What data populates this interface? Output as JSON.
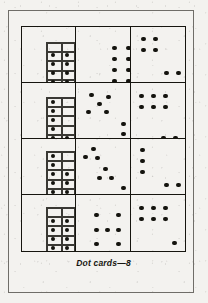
{
  "page": {
    "caption": "Dot cards—8",
    "ink_color": "#14130e",
    "paper_color": "#f3f2ef",
    "border_color": "#6f6d68"
  },
  "cards": [
    {
      "id": "card-r1c1",
      "row": 1,
      "column": 1,
      "total_dots": 9,
      "layout": "ten-frame",
      "frame": {
        "columns": 2,
        "rows": 5,
        "filled_cells": 8,
        "empty_cells": 2,
        "empty_row": "top"
      },
      "loose_dots": 1,
      "frame_dots": [
        {
          "x": 31,
          "y": 28
        },
        {
          "x": 45,
          "y": 28
        },
        {
          "x": 31,
          "y": 37
        },
        {
          "x": 45,
          "y": 37
        },
        {
          "x": 31,
          "y": 46
        },
        {
          "x": 45,
          "y": 46
        },
        {
          "x": 31,
          "y": 55
        },
        {
          "x": 45,
          "y": 55
        }
      ],
      "free_dots": [
        {
          "x": 66,
          "y": 41
        }
      ],
      "frame_box": {
        "x": 24,
        "y": 15,
        "w": 29,
        "h": 46,
        "cols": 2,
        "rows": 5
      }
    },
    {
      "id": "card-r1c2",
      "row": 1,
      "column": 2,
      "total_dots": 8,
      "layout": "array-2x4",
      "frame_box": null,
      "frame_dots": [],
      "free_dots": [
        {
          "x": 38,
          "y": 21
        },
        {
          "x": 52,
          "y": 21
        },
        {
          "x": 38,
          "y": 32
        },
        {
          "x": 52,
          "y": 32
        },
        {
          "x": 38,
          "y": 43
        },
        {
          "x": 52,
          "y": 43
        },
        {
          "x": 38,
          "y": 54
        },
        {
          "x": 52,
          "y": 54
        }
      ]
    },
    {
      "id": "card-r1c3",
      "row": 1,
      "column": 3,
      "total_dots": 8,
      "layout": "two-squares-diagonal",
      "frame_box": null,
      "frame_dots": [],
      "free_dots": [
        {
          "x": 13,
          "y": 12
        },
        {
          "x": 25,
          "y": 12
        },
        {
          "x": 13,
          "y": 23
        },
        {
          "x": 25,
          "y": 23
        },
        {
          "x": 36,
          "y": 46
        },
        {
          "x": 48,
          "y": 46
        },
        {
          "x": 36,
          "y": 57
        },
        {
          "x": 48,
          "y": 57
        }
      ]
    },
    {
      "id": "card-r2c1",
      "row": 2,
      "column": 1,
      "total_dots": 9,
      "layout": "ten-frame",
      "frame": {
        "columns": 2,
        "rows": 5,
        "filled_cells": 6,
        "empty_cells": 4
      },
      "loose_dots": 3,
      "frame_box": {
        "x": 24,
        "y": 14,
        "w": 29,
        "h": 46,
        "cols": 2,
        "rows": 5
      },
      "frame_dots": [
        {
          "x": 31,
          "y": 19
        },
        {
          "x": 31,
          "y": 28
        },
        {
          "x": 31,
          "y": 37
        },
        {
          "x": 31,
          "y": 46
        },
        {
          "x": 31,
          "y": 55
        },
        {
          "x": 45,
          "y": 55
        }
      ],
      "free_dots": [
        {
          "x": 64,
          "y": 22
        },
        {
          "x": 64,
          "y": 32
        },
        {
          "x": 64,
          "y": 42
        }
      ]
    },
    {
      "id": "card-r2c2",
      "row": 2,
      "column": 2,
      "total_dots": 8,
      "layout": "quincunx-plus-column",
      "frame_box": null,
      "frame_dots": [],
      "free_dots": [
        {
          "x": 15,
          "y": 12
        },
        {
          "x": 32,
          "y": 14
        },
        {
          "x": 23,
          "y": 21
        },
        {
          "x": 12,
          "y": 29
        },
        {
          "x": 30,
          "y": 29
        },
        {
          "x": 47,
          "y": 41
        },
        {
          "x": 47,
          "y": 51
        },
        {
          "x": 47,
          "y": 61
        }
      ]
    },
    {
      "id": "card-r2c3",
      "row": 2,
      "column": 3,
      "total_dots": 8,
      "layout": "six-array-plus-pair",
      "frame_box": null,
      "frame_dots": [],
      "free_dots": [
        {
          "x": 11,
          "y": 13
        },
        {
          "x": 23,
          "y": 13
        },
        {
          "x": 35,
          "y": 13
        },
        {
          "x": 11,
          "y": 24
        },
        {
          "x": 23,
          "y": 24
        },
        {
          "x": 35,
          "y": 24
        },
        {
          "x": 33,
          "y": 55
        },
        {
          "x": 45,
          "y": 55
        }
      ]
    },
    {
      "id": "card-r3c1",
      "row": 3,
      "column": 1,
      "total_dots": 8,
      "layout": "ten-frame",
      "frame": {
        "columns": 2,
        "rows": 5,
        "filled_cells": 8,
        "empty_cells": 2
      },
      "loose_dots": 0,
      "frame_box": {
        "x": 24,
        "y": 12,
        "w": 29,
        "h": 46,
        "cols": 2,
        "rows": 5
      },
      "frame_dots": [
        {
          "x": 31,
          "y": 17
        },
        {
          "x": 31,
          "y": 26
        },
        {
          "x": 31,
          "y": 35
        },
        {
          "x": 45,
          "y": 35
        },
        {
          "x": 31,
          "y": 44
        },
        {
          "x": 45,
          "y": 44
        },
        {
          "x": 31,
          "y": 53
        },
        {
          "x": 45,
          "y": 53
        }
      ],
      "free_dots": []
    },
    {
      "id": "card-r3c2",
      "row": 3,
      "column": 2,
      "total_dots": 9,
      "layout": "three-triangles-diagonal",
      "frame_box": null,
      "frame_dots": [],
      "free_dots": [
        {
          "x": 17,
          "y": 10
        },
        {
          "x": 9,
          "y": 18
        },
        {
          "x": 21,
          "y": 19
        },
        {
          "x": 29,
          "y": 30
        },
        {
          "x": 23,
          "y": 39
        },
        {
          "x": 35,
          "y": 39
        },
        {
          "x": 47,
          "y": 49
        },
        {
          "x": 41,
          "y": 58
        },
        {
          "x": 53,
          "y": 58
        }
      ]
    },
    {
      "id": "card-r3c3",
      "row": 3,
      "column": 3,
      "total_dots": 7,
      "layout": "column-plus-square",
      "frame_box": null,
      "frame_dots": [],
      "free_dots": [
        {
          "x": 12,
          "y": 11
        },
        {
          "x": 12,
          "y": 22
        },
        {
          "x": 12,
          "y": 33
        },
        {
          "x": 36,
          "y": 46
        },
        {
          "x": 48,
          "y": 46
        },
        {
          "x": 36,
          "y": 57
        },
        {
          "x": 48,
          "y": 57
        }
      ]
    },
    {
      "id": "card-r4c1",
      "row": 4,
      "column": 1,
      "total_dots": 8,
      "layout": "ten-frame",
      "frame": {
        "columns": 2,
        "rows": 5,
        "filled_cells": 8,
        "empty_cells": 2,
        "empty_row": "top"
      },
      "loose_dots": 0,
      "frame_box": {
        "x": 24,
        "y": 12,
        "w": 29,
        "h": 46,
        "cols": 2,
        "rows": 5
      },
      "frame_dots": [
        {
          "x": 31,
          "y": 26
        },
        {
          "x": 45,
          "y": 26
        },
        {
          "x": 31,
          "y": 35
        },
        {
          "x": 45,
          "y": 35
        },
        {
          "x": 31,
          "y": 44
        },
        {
          "x": 45,
          "y": 44
        },
        {
          "x": 31,
          "y": 53
        },
        {
          "x": 45,
          "y": 53
        }
      ],
      "free_dots": []
    },
    {
      "id": "card-r4c2",
      "row": 4,
      "column": 2,
      "total_dots": 8,
      "layout": "ring-3x3-hollow-center",
      "frame_box": null,
      "frame_dots": [],
      "free_dots": [
        {
          "x": 20,
          "y": 20
        },
        {
          "x": 42,
          "y": 20
        },
        {
          "x": 20,
          "y": 35
        },
        {
          "x": 31,
          "y": 35
        },
        {
          "x": 42,
          "y": 35
        },
        {
          "x": 20,
          "y": 49
        },
        {
          "x": 42,
          "y": 49
        }
      ]
    },
    {
      "id": "card-r4c3",
      "row": 4,
      "column": 3,
      "total_dots": 7,
      "layout": "six-array-plus-one",
      "frame_box": null,
      "frame_dots": [],
      "free_dots": [
        {
          "x": 11,
          "y": 13
        },
        {
          "x": 23,
          "y": 13
        },
        {
          "x": 35,
          "y": 13
        },
        {
          "x": 11,
          "y": 24
        },
        {
          "x": 23,
          "y": 24
        },
        {
          "x": 35,
          "y": 24
        },
        {
          "x": 44,
          "y": 48
        }
      ]
    }
  ]
}
